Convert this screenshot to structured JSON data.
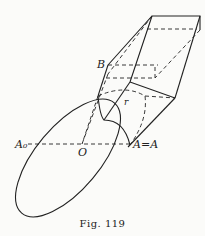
{
  "figure": {
    "caption": "Fig. 119",
    "labels": {
      "B": "B",
      "r": "r",
      "A0": "A₀",
      "O": "O",
      "A_eq_A": "A=A"
    }
  }
}
